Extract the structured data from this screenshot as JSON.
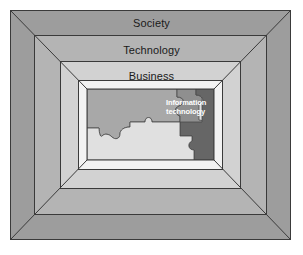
{
  "figure": {
    "type": "nested-perspective-frame-diagram"
  },
  "frames": [
    {
      "id": "society",
      "label": "Society",
      "fill": "#9d9d9d",
      "level": 1
    },
    {
      "id": "technology",
      "label": "Technology",
      "fill": "#b4b4b4",
      "level": 2
    },
    {
      "id": "business",
      "label": "Business",
      "fill": "#d2d2d2",
      "level": 3
    },
    {
      "id": "inner",
      "label": "",
      "fill": "#f2f2f2",
      "level": 4
    }
  ],
  "puzzle": {
    "label_line1": "Information",
    "label_line2": "technology",
    "pieces": [
      {
        "id": "upper-left-piece",
        "fill": "#a8a8a8"
      },
      {
        "id": "lower-light-piece",
        "fill": "#e0e0e0"
      },
      {
        "id": "it-piece",
        "fill": "#8f8f8f"
      },
      {
        "id": "dark-right-piece",
        "fill": "#666666"
      }
    ]
  },
  "colors": {
    "background": "#ffffff",
    "outline": "#3a3a3a",
    "society_fill": "#9d9d9d",
    "technology_fill": "#b4b4b4",
    "business_fill": "#d2d2d2",
    "inner_fill": "#f2f2f2",
    "puzzle_label_text": "#ffffff",
    "frame_label_text": "#1a1a1a"
  }
}
